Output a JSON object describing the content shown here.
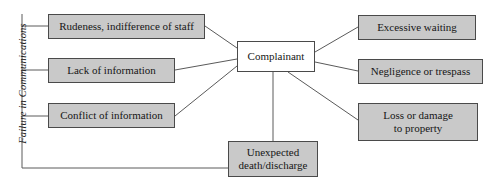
{
  "diagram": {
    "category_label": "Failure in Communications",
    "center": {
      "id": "complainant",
      "label": "Complainant",
      "fill": "#ffffff",
      "stroke": "#4a4a4a",
      "x": 237,
      "y": 41,
      "w": 78,
      "h": 31
    },
    "nodes": [
      {
        "id": "rudeness",
        "label": "Rudeness, indifference of staff",
        "side": "left",
        "fill": "#c9c9c9",
        "stroke": "#4a4a4a",
        "x": 48,
        "y": 14,
        "w": 157,
        "h": 25
      },
      {
        "id": "lack-of-information",
        "label": "Lack of information",
        "side": "left",
        "fill": "#c9c9c9",
        "stroke": "#4a4a4a",
        "x": 48,
        "y": 58,
        "w": 127,
        "h": 25
      },
      {
        "id": "conflict-of-information",
        "label": "Conflict of information",
        "side": "left",
        "fill": "#c9c9c9",
        "stroke": "#4a4a4a",
        "x": 48,
        "y": 103,
        "w": 127,
        "h": 25
      },
      {
        "id": "unexpected-death-discharge",
        "label": "Unexpected\ndeath/discharge",
        "side": "bottom",
        "fill": "#c9c9c9",
        "stroke": "#4a4a4a",
        "x": 228,
        "y": 141,
        "w": 90,
        "h": 36
      },
      {
        "id": "excessive-waiting",
        "label": "Excessive waiting",
        "side": "right",
        "fill": "#c9c9c9",
        "stroke": "#4a4a4a",
        "x": 358,
        "y": 15,
        "w": 118,
        "h": 25
      },
      {
        "id": "negligence-or-trespass",
        "label": "Negligence or trespass",
        "side": "right",
        "fill": "#c9c9c9",
        "stroke": "#4a4a4a",
        "x": 358,
        "y": 59,
        "w": 125,
        "h": 25
      },
      {
        "id": "loss-or-damage-to-property",
        "label": "Loss or damage\nto property",
        "side": "right",
        "fill": "#c9c9c9",
        "stroke": "#4a4a4a",
        "x": 358,
        "y": 103,
        "w": 120,
        "h": 38
      }
    ],
    "connectors": {
      "stroke": "#5a5a5a",
      "width": 1,
      "paths": [
        "M 22 14 L 22 168",
        "M 22 26 L 48 26",
        "M 22 70 L 48 70",
        "M 22 116 L 48 116",
        "M 22 168 L 228 168",
        "M 205 26 L 237 48",
        "M 175 70 L 237 59",
        "M 175 116 L 237 66",
        "M 273 72 L 273 141",
        "M 315 52 L 358 27",
        "M 315 62 L 358 71",
        "M 288 72 L 358 120"
      ]
    }
  }
}
